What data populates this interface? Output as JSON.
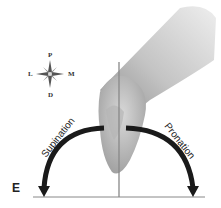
{
  "compass": {
    "top": "P",
    "left": "L",
    "right": "M",
    "bottom": "D"
  },
  "labels": {
    "left_arrow": "Supination",
    "right_arrow": "Pronation",
    "corner": "E"
  },
  "colors": {
    "arrow": "#1a1a1a",
    "axis": "#888888",
    "arm_dark": "#9a9a9a",
    "arm_light": "#e6e6e6"
  }
}
